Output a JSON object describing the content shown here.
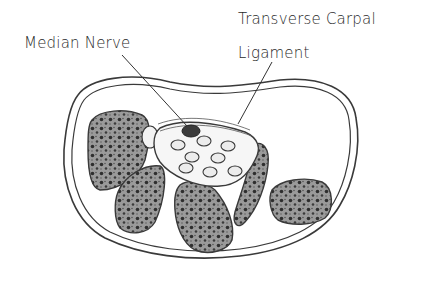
{
  "figure": {
    "labels": {
      "median_nerve": "Median Nerve",
      "ligament_line1": "Transverse Carpal",
      "ligament_line2": "Ligament"
    },
    "colors": {
      "outline": "#3a3a3a",
      "bone_fill": "#8a8a8a",
      "bone_pore": "#2e2e2e",
      "nerve_fill": "#3b3b3b",
      "tendon_fill": "#eeeeee",
      "background": "#ffffff"
    }
  }
}
